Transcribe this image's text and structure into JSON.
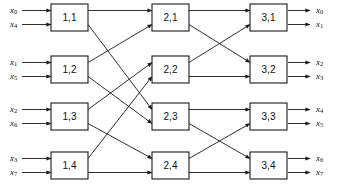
{
  "diagram": {
    "type": "butterfly-interconnection-network",
    "title": "",
    "caption": "",
    "stages": 3,
    "nodes_per_stage": 4,
    "inputs_count": 8,
    "outputs_count": 8,
    "colors": {
      "line": "#1a1a1a",
      "box_fill": "#ffffff",
      "box_stroke": "#1a1a1a",
      "text": "#111111",
      "background": "#ffffff"
    },
    "geometry": {
      "width": 344,
      "height": 196,
      "column_x": [
        51,
        152,
        250
      ],
      "box_width": 37,
      "box_height": 27,
      "row_y_top": [
        4,
        56,
        103,
        152
      ],
      "port_offset": 7,
      "input_x_start": 13,
      "input_arrow_end": 51,
      "output_arrow_start": 288,
      "output_x_end": 322,
      "arrow_head_size": 4.2
    },
    "nodes": [
      {
        "id": "n11",
        "label": "1,1",
        "stage": 1,
        "row": 0
      },
      {
        "id": "n12",
        "label": "1,2",
        "stage": 1,
        "row": 1
      },
      {
        "id": "n13",
        "label": "1,3",
        "stage": 1,
        "row": 2
      },
      {
        "id": "n14",
        "label": "1,4",
        "stage": 1,
        "row": 3
      },
      {
        "id": "n21",
        "label": "2,1",
        "stage": 2,
        "row": 0
      },
      {
        "id": "n22",
        "label": "2,2",
        "stage": 2,
        "row": 1
      },
      {
        "id": "n23",
        "label": "2,3",
        "stage": 2,
        "row": 2
      },
      {
        "id": "n24",
        "label": "2,4",
        "stage": 2,
        "row": 3
      },
      {
        "id": "n31",
        "label": "3,1",
        "stage": 3,
        "row": 0
      },
      {
        "id": "n32",
        "label": "3,2",
        "stage": 3,
        "row": 1
      },
      {
        "id": "n33",
        "label": "3,3",
        "stage": 3,
        "row": 2
      },
      {
        "id": "n34",
        "label": "3,4",
        "stage": 3,
        "row": 3
      }
    ],
    "inputs": [
      {
        "base": "x",
        "sub": "0",
        "row": 0,
        "port": "top"
      },
      {
        "base": "x",
        "sub": "4",
        "row": 0,
        "port": "bottom"
      },
      {
        "base": "x",
        "sub": "1",
        "row": 1,
        "port": "top"
      },
      {
        "base": "x",
        "sub": "5",
        "row": 1,
        "port": "bottom"
      },
      {
        "base": "x",
        "sub": "2",
        "row": 2,
        "port": "top"
      },
      {
        "base": "x",
        "sub": "6",
        "row": 2,
        "port": "bottom"
      },
      {
        "base": "x",
        "sub": "3",
        "row": 3,
        "port": "top"
      },
      {
        "base": "x",
        "sub": "7",
        "row": 3,
        "port": "bottom"
      }
    ],
    "outputs": [
      {
        "base": "x",
        "sub": "0",
        "row": 0,
        "port": "top"
      },
      {
        "base": "x",
        "sub": "1",
        "row": 0,
        "port": "bottom"
      },
      {
        "base": "x",
        "sub": "2",
        "row": 1,
        "port": "top"
      },
      {
        "base": "x",
        "sub": "3",
        "row": 1,
        "port": "bottom"
      },
      {
        "base": "x",
        "sub": "4",
        "row": 2,
        "port": "top"
      },
      {
        "base": "x",
        "sub": "5",
        "row": 2,
        "port": "bottom"
      },
      {
        "base": "x",
        "sub": "6",
        "row": 3,
        "port": "top"
      },
      {
        "base": "x",
        "sub": "7",
        "row": 3,
        "port": "bottom"
      }
    ],
    "edges_stage1_to_stage2": [
      {
        "from_row": 0,
        "from_port": "top",
        "to_row": 0,
        "to_port": "top"
      },
      {
        "from_row": 0,
        "from_port": "bottom",
        "to_row": 2,
        "to_port": "top"
      },
      {
        "from_row": 1,
        "from_port": "top",
        "to_row": 0,
        "to_port": "bottom"
      },
      {
        "from_row": 1,
        "from_port": "bottom",
        "to_row": 2,
        "to_port": "bottom"
      },
      {
        "from_row": 2,
        "from_port": "top",
        "to_row": 1,
        "to_port": "top"
      },
      {
        "from_row": 2,
        "from_port": "bottom",
        "to_row": 3,
        "to_port": "top"
      },
      {
        "from_row": 3,
        "from_port": "top",
        "to_row": 1,
        "to_port": "bottom"
      },
      {
        "from_row": 3,
        "from_port": "bottom",
        "to_row": 3,
        "to_port": "bottom"
      }
    ],
    "edges_stage2_to_stage3": [
      {
        "from_row": 0,
        "from_port": "top",
        "to_row": 0,
        "to_port": "top"
      },
      {
        "from_row": 0,
        "from_port": "bottom",
        "to_row": 1,
        "to_port": "top"
      },
      {
        "from_row": 1,
        "from_port": "top",
        "to_row": 0,
        "to_port": "bottom"
      },
      {
        "from_row": 1,
        "from_port": "bottom",
        "to_row": 1,
        "to_port": "bottom"
      },
      {
        "from_row": 2,
        "from_port": "top",
        "to_row": 2,
        "to_port": "top"
      },
      {
        "from_row": 2,
        "from_port": "bottom",
        "to_row": 3,
        "to_port": "top"
      },
      {
        "from_row": 3,
        "from_port": "top",
        "to_row": 2,
        "to_port": "bottom"
      },
      {
        "from_row": 3,
        "from_port": "bottom",
        "to_row": 3,
        "to_port": "bottom"
      }
    ]
  }
}
